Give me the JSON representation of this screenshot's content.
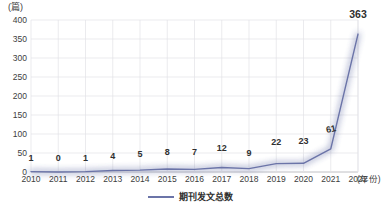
{
  "chart_data": {
    "type": "line",
    "title": "",
    "xlabel": "(年份)",
    "ylabel": "(篇)",
    "y_unit_caption": "(篇)",
    "x_axis_caption": "(年份)",
    "categories": [
      "2010",
      "2011",
      "2012",
      "2013",
      "2014",
      "2015",
      "2016",
      "2017",
      "2018",
      "2019",
      "2020",
      "2021",
      "2022"
    ],
    "values": [
      1,
      0,
      1,
      4,
      5,
      8,
      7,
      12,
      9,
      22,
      23,
      61,
      363
    ],
    "series": [
      {
        "name": "期刊发文总数",
        "values": [
          1,
          0,
          1,
          4,
          5,
          8,
          7,
          12,
          9,
          22,
          23,
          61,
          363
        ],
        "color": "#6b74a8"
      }
    ],
    "ylim": [
      0,
      400
    ],
    "y_ticks": [
      "0",
      "50",
      "100",
      "150",
      "200",
      "250",
      "300",
      "350",
      "400"
    ],
    "y_tick_values": [
      0,
      50,
      100,
      150,
      200,
      250,
      300,
      350,
      400
    ],
    "xlim_categories": 13,
    "grid": true,
    "grid_x": true,
    "grid_y": true,
    "grid_color": "#e2e2e6",
    "legend_position": "bottom-center",
    "point_labels": [
      "1",
      "0",
      "1",
      "4",
      "5",
      "8",
      "7",
      "12",
      "9",
      "22",
      "23",
      "61",
      "363"
    ]
  },
  "legend": {
    "entries": [
      {
        "label": "期刊发文总数",
        "color": "#6b74a8"
      }
    ]
  }
}
